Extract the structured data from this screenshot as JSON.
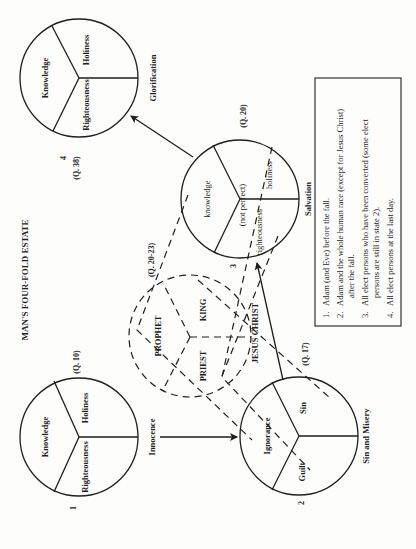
{
  "title": "MAN'S FOUR-FOLD ESTATE",
  "states": [
    {
      "number": "1",
      "name": "Innocence",
      "question": "(Q. 10)",
      "segments": [
        "Knowledge",
        "Holiness",
        "Righteousness"
      ]
    },
    {
      "number": "2",
      "name": "Sin and Misery",
      "question": "(Q. 17)",
      "segments": [
        "Ignorance",
        "Sin",
        "Guilt"
      ]
    },
    {
      "number": "3",
      "name": "Salvation",
      "question": "(Q. 20)",
      "segments": [
        "knowledge",
        "holiness",
        "righteousness"
      ],
      "note": "(not perfect)"
    },
    {
      "number": "4",
      "name": "Glorification",
      "question": "(Q. 38)",
      "segments": [
        "Knowledge",
        "Holiness",
        "Righteousness"
      ]
    }
  ],
  "mediator": {
    "name": "JESUS CHRIST",
    "question": "(Q. 20-23)",
    "offices": [
      "PROPHET",
      "KING",
      "PRIEST"
    ]
  },
  "legend": {
    "items": [
      {
        "num": "1.",
        "lines": [
          "Adam (and Eve) before the fall."
        ]
      },
      {
        "num": "2.",
        "lines": [
          "Adam and the whole human race (except for Jesus Christ)",
          "after the fall."
        ]
      },
      {
        "num": "3.",
        "lines": [
          "All elect persons who have been converted (some elect",
          "persons are still in state 2)."
        ]
      },
      {
        "num": "4.",
        "lines": [
          "All elect persons at the last day."
        ]
      }
    ]
  },
  "colors": {
    "ink": "#1e1e1e",
    "paper": "#fdfdfb"
  }
}
